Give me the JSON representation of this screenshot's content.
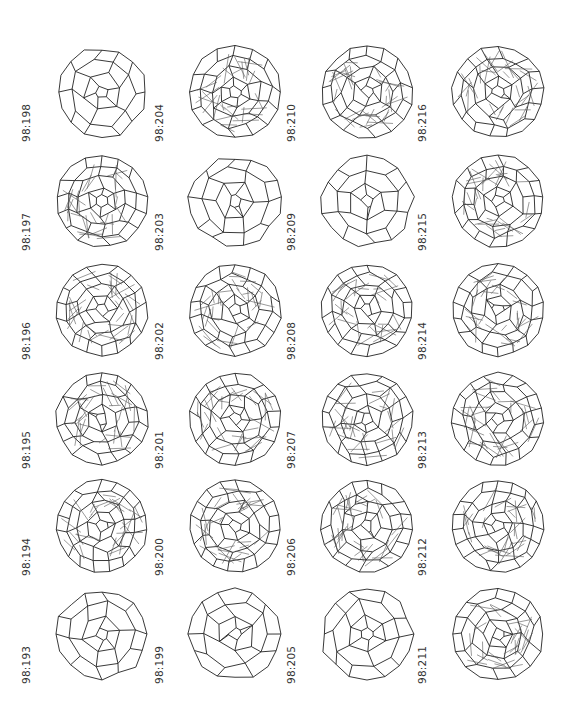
{
  "figure": {
    "layout": {
      "columns": 4,
      "rows": 6
    },
    "isomers": [
      {
        "label": "98:198",
        "col": 0,
        "row": 0,
        "style": "front",
        "seed": 198
      },
      {
        "label": "98:197",
        "col": 0,
        "row": 1,
        "style": "wire",
        "seed": 197
      },
      {
        "label": "98:196",
        "col": 0,
        "row": 2,
        "style": "wire",
        "seed": 196
      },
      {
        "label": "98:195",
        "col": 0,
        "row": 3,
        "style": "wire",
        "seed": 195
      },
      {
        "label": "98:194",
        "col": 0,
        "row": 4,
        "style": "wire",
        "seed": 194
      },
      {
        "label": "98:193",
        "col": 0,
        "row": 5,
        "style": "front",
        "seed": 193
      },
      {
        "label": "98:204",
        "col": 1,
        "row": 0,
        "style": "wire",
        "seed": 204
      },
      {
        "label": "98:203",
        "col": 1,
        "row": 1,
        "style": "front",
        "seed": 203
      },
      {
        "label": "98:202",
        "col": 1,
        "row": 2,
        "style": "wire",
        "seed": 202
      },
      {
        "label": "98:201",
        "col": 1,
        "row": 3,
        "style": "wire",
        "seed": 201
      },
      {
        "label": "98:200",
        "col": 1,
        "row": 4,
        "style": "wire",
        "seed": 200
      },
      {
        "label": "98:199",
        "col": 1,
        "row": 5,
        "style": "front",
        "seed": 199
      },
      {
        "label": "98:210",
        "col": 2,
        "row": 0,
        "style": "wire",
        "seed": 210
      },
      {
        "label": "98:209",
        "col": 2,
        "row": 1,
        "style": "front",
        "seed": 209
      },
      {
        "label": "98:208",
        "col": 2,
        "row": 2,
        "style": "wire",
        "seed": 208
      },
      {
        "label": "98:207",
        "col": 2,
        "row": 3,
        "style": "wire",
        "seed": 207
      },
      {
        "label": "98:206",
        "col": 2,
        "row": 4,
        "style": "wire",
        "seed": 206
      },
      {
        "label": "98:205",
        "col": 2,
        "row": 5,
        "style": "front",
        "seed": 205
      },
      {
        "label": "98:216",
        "col": 3,
        "row": 0,
        "style": "wire",
        "seed": 216
      },
      {
        "label": "98:215",
        "col": 3,
        "row": 1,
        "style": "wire",
        "seed": 215
      },
      {
        "label": "98:214",
        "col": 3,
        "row": 2,
        "style": "wire",
        "seed": 214
      },
      {
        "label": "98:213",
        "col": 3,
        "row": 3,
        "style": "wire",
        "seed": 213
      },
      {
        "label": "98:212",
        "col": 3,
        "row": 4,
        "style": "wire",
        "seed": 212
      },
      {
        "label": "98:211",
        "col": 3,
        "row": 5,
        "style": "wire",
        "seed": 211
      }
    ]
  }
}
